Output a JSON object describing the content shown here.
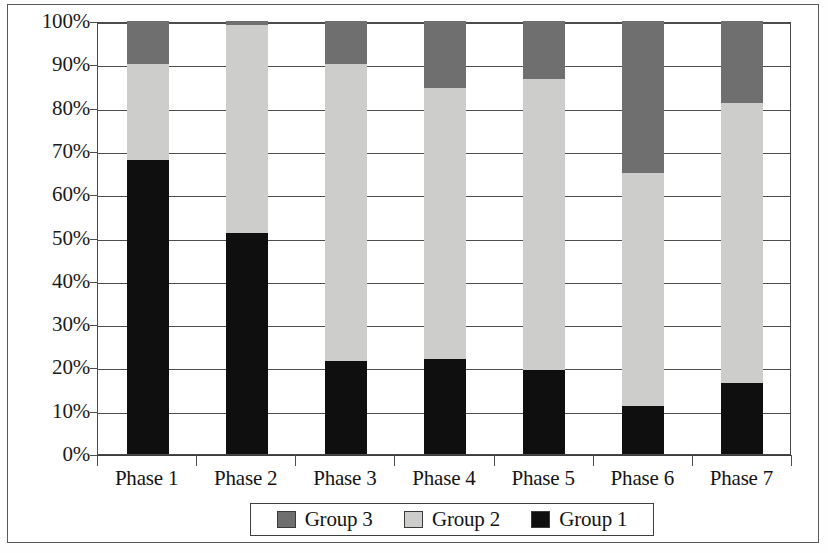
{
  "chart_data": {
    "type": "bar",
    "subtype": "stacked-percentage",
    "title": "",
    "xlabel": "",
    "ylabel": "",
    "ylim": [
      0,
      100
    ],
    "y_unit": "%",
    "grid": true,
    "legend_position": "bottom",
    "categories": [
      "Phase 1",
      "Phase 2",
      "Phase 3",
      "Phase 4",
      "Phase 5",
      "Phase 6",
      "Phase 7"
    ],
    "y_ticks": [
      "0%",
      "10%",
      "20%",
      "30%",
      "40%",
      "50%",
      "60%",
      "70%",
      "80%",
      "90%",
      "100%"
    ],
    "y_tick_values": [
      0,
      10,
      20,
      30,
      40,
      50,
      60,
      70,
      80,
      90,
      100
    ],
    "stack_order_bottom_to_top": [
      "Group 1",
      "Group 2",
      "Group 3"
    ],
    "series": [
      {
        "name": "Group 1",
        "color": "#100f0f",
        "values": [
          68,
          51,
          21.5,
          22,
          19.5,
          11,
          16.5
        ]
      },
      {
        "name": "Group 2",
        "color": "#cdcdcb",
        "values": [
          22,
          48,
          68.5,
          62.5,
          67,
          54,
          64.5
        ]
      },
      {
        "name": "Group 3",
        "color": "#6f6f6f",
        "values": [
          10,
          1,
          10,
          15.5,
          13.5,
          35,
          19
        ]
      }
    ],
    "cumulative_tops": {
      "Group 1": [
        68,
        51,
        21.5,
        22,
        19.5,
        11,
        16.5
      ],
      "Group 2": [
        90,
        99,
        90,
        84.5,
        86.5,
        65,
        81
      ],
      "Group 3": [
        100,
        100,
        100,
        100,
        100,
        100,
        100
      ]
    }
  },
  "legend": {
    "items": [
      {
        "label": "Group 3",
        "color": "#6f6f6f"
      },
      {
        "label": "Group 2",
        "color": "#cdcdcb"
      },
      {
        "label": "Group 1",
        "color": "#100f0f"
      }
    ]
  },
  "axis": {
    "y_labels": [
      "100%",
      "90%",
      "80%",
      "70%",
      "60%",
      "50%",
      "40%",
      "30%",
      "20%",
      "10%",
      "0%"
    ],
    "x_labels": [
      "Phase 1",
      "Phase 2",
      "Phase 3",
      "Phase 4",
      "Phase 5",
      "Phase 6",
      "Phase 7"
    ]
  }
}
